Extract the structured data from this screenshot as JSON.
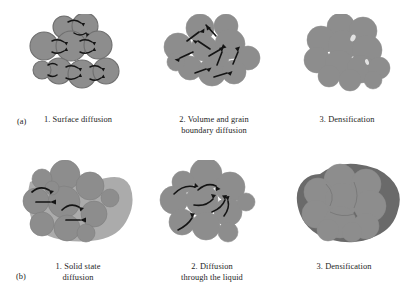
{
  "figure": {
    "colors": {
      "particle_fill": "#8d8d8d",
      "particle_stroke": "#6f6f6f",
      "particle_dark_rim": "#6a6a6a",
      "liquid_phase": "#666666",
      "arrow": "#141414",
      "background": "#ffffff",
      "text": "#1c1c1c"
    },
    "rows": [
      {
        "key": "a",
        "label": "(a)",
        "name": "solid-state-sintering",
        "panels": [
          {
            "index": 1,
            "caption": "1. Surface diffusion",
            "mechanism": "surface-diffusion",
            "arrow_style": "curved-neck-arrows",
            "arrow_count": 12,
            "particle_count": 9,
            "particles_fused": true,
            "pores_visible": true
          },
          {
            "index": 2,
            "caption": "2. Volume and grain\nboundary diffusion",
            "mechanism": "volume-and-grain-boundary-diffusion",
            "arrow_style": "straight-directional-arrows",
            "arrow_count": 9,
            "particle_count": 11,
            "particles_fused": true,
            "pores_visible": true
          },
          {
            "index": 3,
            "caption": "3. Densification",
            "mechanism": "densification",
            "arrow_style": "none",
            "arrow_count": 0,
            "particle_count": 12,
            "particles_fused": true,
            "pores_visible": false
          }
        ]
      },
      {
        "key": "b",
        "label": "(b)",
        "name": "liquid-phase-sintering",
        "panels": [
          {
            "index": 1,
            "caption": "1. Solid state\ndiffusion",
            "mechanism": "solid-state-diffusion",
            "arrow_style": "curved-plus-straight-arrows",
            "arrow_count": 4,
            "particle_count": 11,
            "particles_fused": false,
            "liquid_phase_visible": true
          },
          {
            "index": 2,
            "caption": "2. Diffusion\nthrough the liquid",
            "mechanism": "diffusion-through-liquid",
            "arrow_style": "curved-arrows",
            "arrow_count": 6,
            "particle_count": 10,
            "particles_fused": true,
            "liquid_phase_visible": true
          },
          {
            "index": 3,
            "caption": "3. Densification",
            "mechanism": "densification",
            "arrow_style": "none",
            "arrow_count": 0,
            "particle_count": 10,
            "particles_fused": true,
            "liquid_phase_visible": true,
            "outline_dark": true
          }
        ]
      }
    ]
  }
}
